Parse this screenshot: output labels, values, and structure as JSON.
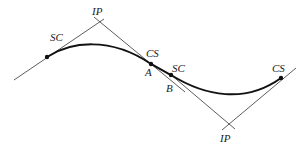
{
  "diagram": {
    "type": "reverse-curve-with-spirals",
    "labels": {
      "sc1": "SC",
      "ip1": "IP",
      "cs1": "CS",
      "a": "A",
      "sc2": "SC",
      "b": "B",
      "ip2": "IP",
      "cs2": "CS"
    },
    "colors": {
      "curve": "#111111",
      "tangent": "#333333",
      "background": "#ffffff"
    }
  }
}
